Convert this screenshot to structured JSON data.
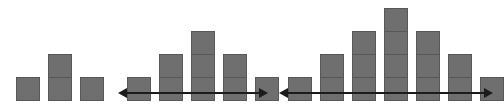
{
  "figure": {
    "canvas": {
      "width": 501,
      "height": 112,
      "background": "#ffffff"
    },
    "cell": {
      "width": 24,
      "height": 24,
      "fill": "#6f6f6f",
      "stroke": "#585858"
    },
    "baseline_y": 101,
    "arrow": {
      "color": "#1c1c1c",
      "line_thickness": 2,
      "head_length": 9,
      "head_width": 10,
      "style": "double-headed-horizontal"
    },
    "groups": [
      {
        "name": "group-1",
        "label": "1-2-1 pyramid",
        "left": 16,
        "column_count": 3,
        "column_gap": 8,
        "heights": [
          1,
          2,
          1
        ],
        "total_cells": 4,
        "has_arrow": false,
        "arrow_y": 93,
        "arrow_start_x": 0,
        "arrow_end_x": 0
      },
      {
        "name": "group-2",
        "label": "1-2-3-2-1 pyramid",
        "left": 127,
        "column_count": 5,
        "column_gap": 8,
        "heights": [
          1,
          2,
          3,
          2,
          1
        ],
        "total_cells": 9,
        "has_arrow": true,
        "arrow_y": 93,
        "arrow_start_x": 118,
        "arrow_end_x": 268
      },
      {
        "name": "group-3",
        "label": "1-2-3-4-3-2-1 pyramid",
        "left": 288,
        "column_count": 7,
        "column_gap": 8,
        "heights": [
          1,
          2,
          3,
          4,
          3,
          2,
          1
        ],
        "total_cells": 16,
        "has_arrow": true,
        "arrow_y": 93,
        "arrow_start_x": 279,
        "arrow_end_x": 493
      }
    ]
  }
}
